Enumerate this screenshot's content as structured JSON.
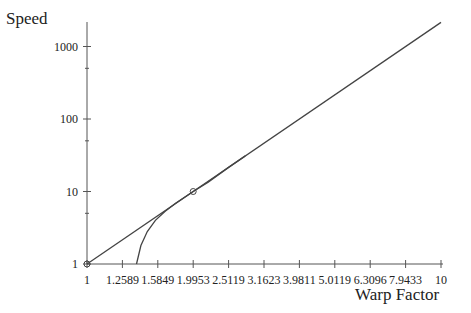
{
  "chart_data": {
    "type": "line",
    "title": "",
    "xlabel": "Warp Factor",
    "ylabel": "Speed",
    "xscale": "log",
    "yscale": "log",
    "xlim": [
      1,
      10
    ],
    "ylim": [
      1,
      2154
    ],
    "x_ticks": [
      "1",
      "1.2589",
      "1.5849",
      "1.9953",
      "2.5119",
      "3.1623",
      "3.9811",
      "5.0119",
      "6.3096",
      "7.9433",
      "10"
    ],
    "x_tick_values": [
      1,
      1.2589,
      1.5849,
      1.9953,
      2.5119,
      3.1623,
      3.9811,
      5.0119,
      6.3096,
      7.9433,
      10
    ],
    "y_ticks": [
      "1",
      "10",
      "100",
      "1000"
    ],
    "y_tick_values": [
      1,
      10,
      100,
      1000
    ],
    "y_minor_ticks": [
      5,
      50,
      500
    ],
    "grid": false,
    "legend": null,
    "series": [
      {
        "name": "Speed = Warp^(10/3)",
        "style": "straight",
        "x": [
          1,
          1.2589,
          1.5849,
          1.9953,
          2.5119,
          3.1623,
          3.9811,
          5.0119,
          6.3096,
          7.9433,
          10
        ],
        "y": [
          1,
          2.15,
          4.64,
          10,
          21.5,
          46.4,
          100,
          215,
          464,
          1000,
          2154
        ]
      },
      {
        "name": "Curve",
        "style": "curve",
        "x": [
          1.38,
          1.42,
          1.48,
          1.56,
          1.66,
          1.78,
          1.9953,
          2.2,
          2.5119,
          2.8
        ],
        "y": [
          1,
          1.8,
          2.8,
          4.0,
          5.3,
          6.9,
          10,
          13.5,
          21.5,
          31
        ]
      }
    ],
    "markers": [
      {
        "x": 1,
        "y": 1,
        "shape": "circle"
      },
      {
        "x": 1.9953,
        "y": 10,
        "shape": "circle"
      }
    ]
  }
}
